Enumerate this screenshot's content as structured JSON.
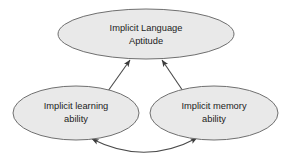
{
  "diagram": {
    "type": "concept-map",
    "background_color": "#ffffff",
    "node_fill_color": "#e9e9e9",
    "node_border_color": "#6f6f6f",
    "edge_color": "#4a4a4a",
    "text_color": "#1c1c1c",
    "nodes": [
      {
        "id": "implicit-language-aptitude",
        "lines": [
          "Implicit Language",
          "Aptitude"
        ],
        "line1": "Implicit Language",
        "line2": "Aptitude",
        "cx": 146,
        "cy": 34,
        "rx": 88,
        "ry": 25
      },
      {
        "id": "implicit-learning-ability",
        "lines": [
          "Implicit learning",
          "ability"
        ],
        "line1": "Implicit learning",
        "line2": "ability",
        "cx": 76,
        "cy": 113,
        "rx": 63,
        "ry": 27
      },
      {
        "id": "implicit-memory-ability",
        "lines": [
          "Implicit memory",
          "ability"
        ],
        "line1": "Implicit memory",
        "line2": "ability",
        "cx": 214,
        "cy": 113,
        "rx": 64,
        "ry": 27
      }
    ],
    "edges": [
      {
        "id": "learning-to-aptitude",
        "from": "implicit-learning-ability",
        "to": "implicit-language-aptitude",
        "style": "straight",
        "arrowheads": "end"
      },
      {
        "id": "memory-to-aptitude",
        "from": "implicit-memory-ability",
        "to": "implicit-language-aptitude",
        "style": "straight",
        "arrowheads": "end"
      },
      {
        "id": "learning-memory-bidirectional",
        "from": "implicit-learning-ability",
        "to": "implicit-memory-ability",
        "style": "curved",
        "arrowheads": "both"
      }
    ]
  }
}
